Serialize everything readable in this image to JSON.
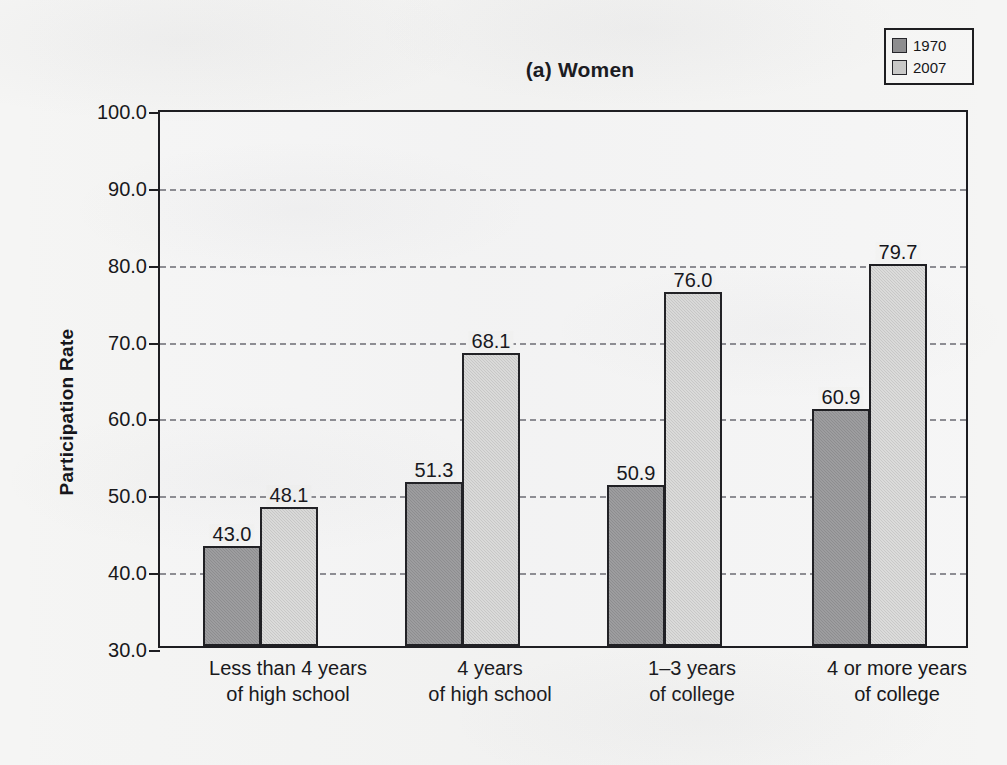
{
  "chart_data": {
    "type": "bar",
    "title": "(a) Women",
    "xlabel": "",
    "ylabel": "Participation Rate",
    "ylim": [
      30.0,
      100.0
    ],
    "ytick_step": 10.0,
    "ytick_labels": [
      "100.0",
      "90.0",
      "80.0",
      "70.0",
      "60.0",
      "50.0",
      "40.0",
      "30.0"
    ],
    "ytick_values": [
      100.0,
      90.0,
      80.0,
      70.0,
      60.0,
      50.0,
      40.0,
      30.0
    ],
    "grid": true,
    "grid_axis": "y",
    "grid_style": "dashed",
    "legend_position": "top-right",
    "categories": [
      [
        "Less than 4 years",
        "of high school"
      ],
      [
        "4 years",
        "of high school"
      ],
      [
        "1–3 years",
        "of college"
      ],
      [
        "4 or more years",
        "of college"
      ]
    ],
    "series": [
      {
        "name": "1970",
        "color": "#8d8d8f",
        "values": [
          43.0,
          51.3,
          50.9,
          60.9
        ],
        "labels": [
          "43.0",
          "51.3",
          "50.9",
          "60.9"
        ]
      },
      {
        "name": "2007",
        "color": "#c9c9c8",
        "values": [
          48.1,
          68.1,
          76.0,
          79.7
        ],
        "labels": [
          "48.1",
          "68.1",
          "76.0",
          "79.7"
        ]
      }
    ]
  },
  "legend": {
    "items": [
      {
        "label": "1970",
        "swatch_color": "#8d8d8f"
      },
      {
        "label": "2007",
        "swatch_color": "#c9c9c8"
      }
    ]
  }
}
